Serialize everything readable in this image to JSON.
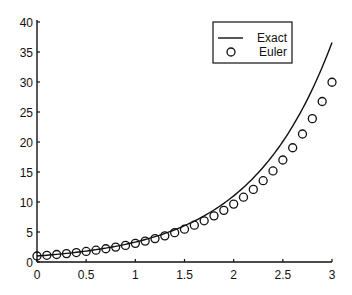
{
  "chart_data": {
    "type": "line",
    "title": "",
    "xlabel": "",
    "ylabel": "",
    "xlim": [
      0,
      3
    ],
    "ylim": [
      0,
      40
    ],
    "grid": false,
    "legend_position": "upper right",
    "x_ticks": [
      0,
      0.5,
      1,
      1.5,
      2,
      2.5,
      3
    ],
    "x_tick_labels": [
      "0",
      "0.5",
      "1",
      "1.5",
      "2",
      "2.5",
      "3"
    ],
    "y_ticks": [
      0,
      5,
      10,
      15,
      20,
      25,
      30,
      35,
      40
    ],
    "y_tick_labels": [
      "0",
      "5",
      "10",
      "15",
      "20",
      "25",
      "30",
      "35",
      "40"
    ],
    "series": [
      {
        "name": "Exact",
        "style": "solid-line",
        "color": "#111111",
        "x": [
          0,
          0.25,
          0.5,
          0.75,
          1,
          1.25,
          1.5,
          1.75,
          2,
          2.25,
          2.5,
          2.75,
          3
        ],
        "values": [
          1.0,
          1.35,
          1.82,
          2.46,
          3.32,
          4.48,
          6.05,
          8.17,
          11.02,
          14.88,
          20.09,
          27.11,
          36.6
        ]
      },
      {
        "name": "Euler",
        "style": "open-circle-markers",
        "color": "#111111",
        "x": [
          0,
          0.1,
          0.2,
          0.3,
          0.4,
          0.5,
          0.6,
          0.7,
          0.8,
          0.9,
          1.0,
          1.1,
          1.2,
          1.3,
          1.4,
          1.5,
          1.6,
          1.7,
          1.8,
          1.9,
          2.0,
          2.1,
          2.2,
          2.3,
          2.4,
          2.5,
          2.6,
          2.7,
          2.8,
          2.9,
          3.0
        ],
        "values": [
          1.0,
          1.12,
          1.25,
          1.4,
          1.57,
          1.76,
          1.97,
          2.21,
          2.48,
          2.77,
          3.11,
          3.48,
          3.9,
          4.36,
          4.89,
          5.47,
          6.13,
          6.87,
          7.69,
          8.61,
          9.65,
          10.8,
          12.1,
          13.55,
          15.18,
          17.0,
          19.04,
          21.33,
          23.89,
          26.75,
          29.96
        ]
      }
    ]
  },
  "legend": {
    "items": [
      {
        "label": "Exact",
        "symbol": "line"
      },
      {
        "label": "Euler",
        "symbol": "circle"
      }
    ]
  }
}
